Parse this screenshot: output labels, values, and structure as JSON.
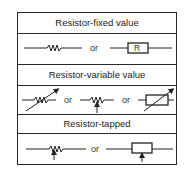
{
  "sections": [
    {
      "title": "Resistor-fixed value",
      "separator": "or",
      "box_label": "R"
    },
    {
      "title": "Resistor-variable value",
      "separators": [
        "or",
        "or"
      ]
    },
    {
      "title": "Resistor-tapped",
      "separator": "or"
    }
  ]
}
